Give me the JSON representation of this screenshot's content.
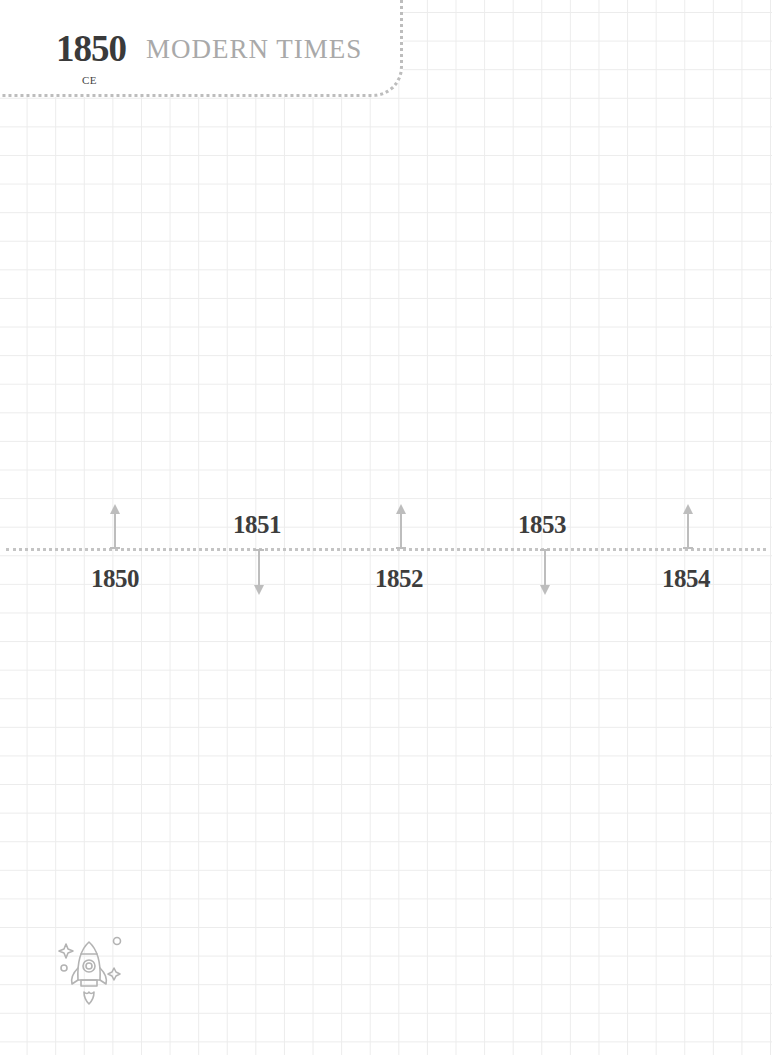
{
  "header": {
    "year": "1850",
    "era_suffix": "CE",
    "title": "MODERN TIMES"
  },
  "timeline": {
    "events": [
      {
        "year": "1850",
        "arrow": "up",
        "label_position": "below"
      },
      {
        "year": "1851",
        "arrow": "down",
        "label_position": "above"
      },
      {
        "year": "1852",
        "arrow": "up",
        "label_position": "below"
      },
      {
        "year": "1853",
        "arrow": "down",
        "label_position": "above"
      },
      {
        "year": "1854",
        "arrow": "up",
        "label_position": "below"
      }
    ]
  },
  "decoration": {
    "icon": "rocket-icon"
  },
  "colors": {
    "text_dark": "#3a3a3a",
    "text_light": "#a9a9a9",
    "dotted_line": "#c4c4c4",
    "arrow": "#bdbdbd",
    "grid": "#ececec"
  }
}
